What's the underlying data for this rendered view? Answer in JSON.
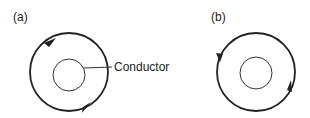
{
  "panels": [
    {
      "label": "(a)",
      "direction": "clockwise"
    },
    {
      "label": "(b)",
      "direction": "counterclockwise"
    }
  ],
  "annotation": {
    "conductor_label": "Conductor"
  },
  "colors": {
    "stroke": "#222222",
    "background": "#ffffff"
  }
}
